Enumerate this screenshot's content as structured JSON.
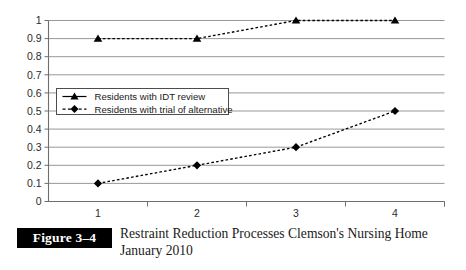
{
  "figure": {
    "number_label": "Figure 3–4",
    "caption_line_1": "Restraint Reduction Processes Clemson's Nursing Home",
    "caption_line_2": "January 2010"
  },
  "legend": {
    "position": "inside-left",
    "entries": [
      {
        "label": "Residents with IDT review",
        "marker": "triangle-marker",
        "line": "solid-dash"
      },
      {
        "label": "Residents with trial of alternative",
        "marker": "diamond-marker",
        "line": "dashed"
      }
    ]
  },
  "axes": {
    "y_tick_labels": [
      "1",
      "0.9",
      "0.8",
      "0.7",
      "0.6",
      "0.5",
      "0.4",
      "0.3",
      "0.2",
      "0.1",
      "0"
    ],
    "x_tick_labels": [
      "1",
      "2",
      "3",
      "4"
    ]
  },
  "colors": {
    "series": "#000000",
    "gridline": "#8c8c8c",
    "axis": "#6e6e6e",
    "background": "#ffffff",
    "caption_box": "#000000",
    "caption_text": "#1a1a1a"
  },
  "chart_data": {
    "type": "line",
    "title": "Restraint Reduction Processes Clemson's Nursing Home January 2010",
    "xlabel": "",
    "ylabel": "",
    "categories": [
      "1",
      "2",
      "3",
      "4"
    ],
    "x": [
      1,
      2,
      3,
      4
    ],
    "series": [
      {
        "name": "Residents with IDT review",
        "values": [
          0.9,
          0.9,
          1.0,
          1.0
        ],
        "marker": "triangle",
        "linestyle": "dashed",
        "color": "#000000"
      },
      {
        "name": "Residents with trial of alternative",
        "values": [
          0.1,
          0.2,
          0.3,
          0.5
        ],
        "marker": "diamond",
        "linestyle": "dashed",
        "color": "#000000"
      }
    ],
    "ylim": [
      0,
      1
    ],
    "ytick_values": [
      0,
      0.1,
      0.2,
      0.3,
      0.4,
      0.5,
      0.6,
      0.7,
      0.8,
      0.9,
      1
    ],
    "grid": "horizontal",
    "legend_position": "inside-left"
  }
}
